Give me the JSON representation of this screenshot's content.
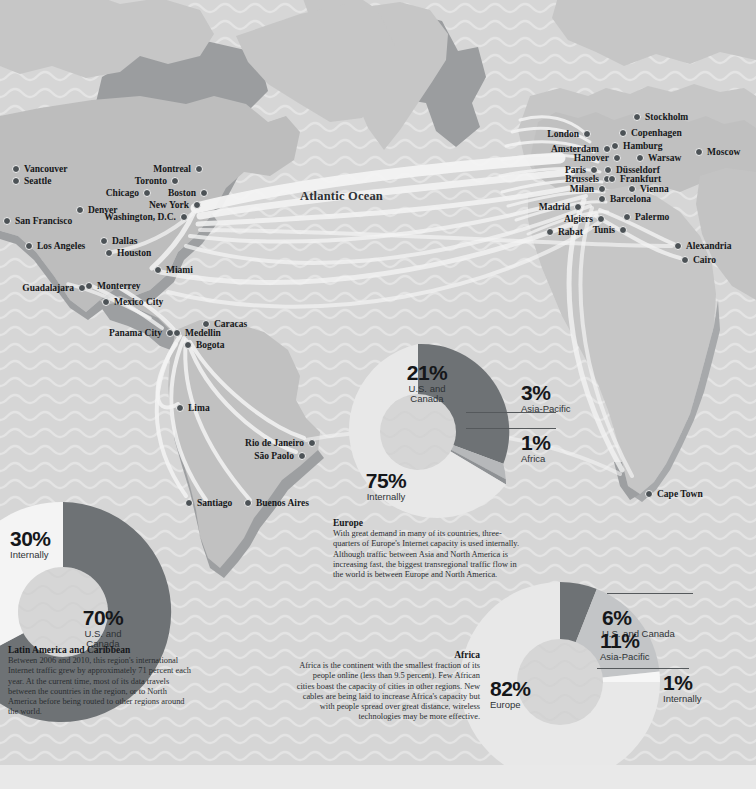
{
  "map": {
    "ocean_label": "Atlantic Ocean",
    "colors": {
      "background": "#d6d6d6",
      "wave": "#e2e2e2",
      "land": "#c6c6c6",
      "land_shadow": "#9d9fa1",
      "cable": "#f4f4f4",
      "marker": "#4c5256",
      "dark_slice": "#6e7275",
      "mid_slice": "#b4b6b8",
      "light_slice": "#e6e6e6"
    },
    "cities": [
      {
        "name": "Vancouver",
        "x": 12,
        "y": 164,
        "side": "right"
      },
      {
        "name": "Seattle",
        "x": 12,
        "y": 176,
        "side": "right"
      },
      {
        "name": "Montreal",
        "x": 189,
        "y": 164,
        "side": "left"
      },
      {
        "name": "Toronto",
        "x": 165,
        "y": 176,
        "side": "left"
      },
      {
        "name": "Chicago",
        "x": 137,
        "y": 188,
        "side": "left"
      },
      {
        "name": "Boston",
        "x": 194,
        "y": 188,
        "side": "left"
      },
      {
        "name": "New York",
        "x": 187,
        "y": 200,
        "side": "left"
      },
      {
        "name": "Denver",
        "x": 76,
        "y": 205,
        "side": "right"
      },
      {
        "name": "Washington, D.C.",
        "x": 174,
        "y": 212,
        "side": "left"
      },
      {
        "name": "San Francisco",
        "x": 3,
        "y": 216,
        "side": "right"
      },
      {
        "name": "Dallas",
        "x": 100,
        "y": 236,
        "side": "right"
      },
      {
        "name": "Houston",
        "x": 105,
        "y": 248,
        "side": "right"
      },
      {
        "name": "Los Angeles",
        "x": 25,
        "y": 241,
        "side": "right"
      },
      {
        "name": "Miami",
        "x": 154,
        "y": 265,
        "side": "right"
      },
      {
        "name": "Monterrey",
        "x": 85,
        "y": 281,
        "side": "right"
      },
      {
        "name": "Guadalajara",
        "x": 72,
        "y": 283,
        "side": "left"
      },
      {
        "name": "Mexico City",
        "x": 102,
        "y": 297,
        "side": "right"
      },
      {
        "name": "Panama City",
        "x": 160,
        "y": 328,
        "side": "left"
      },
      {
        "name": "Caracas",
        "x": 202,
        "y": 319,
        "side": "right"
      },
      {
        "name": "Medellin",
        "x": 173,
        "y": 328,
        "side": "right"
      },
      {
        "name": "Bogota",
        "x": 184,
        "y": 340,
        "side": "right"
      },
      {
        "name": "Lima",
        "x": 176,
        "y": 403,
        "side": "right"
      },
      {
        "name": "Rio de Janeiro",
        "x": 302,
        "y": 438,
        "side": "left"
      },
      {
        "name": "São Paolo",
        "x": 292,
        "y": 451,
        "side": "left"
      },
      {
        "name": "Santiago",
        "x": 185,
        "y": 498,
        "side": "right"
      },
      {
        "name": "Buenos Aires",
        "x": 244,
        "y": 498,
        "side": "right"
      },
      {
        "name": "Stockholm",
        "x": 633,
        "y": 112,
        "side": "right"
      },
      {
        "name": "Copenhagen",
        "x": 619,
        "y": 128,
        "side": "right"
      },
      {
        "name": "London",
        "x": 577,
        "y": 129,
        "side": "left"
      },
      {
        "name": "Hamburg",
        "x": 611,
        "y": 141,
        "side": "right"
      },
      {
        "name": "Moscow",
        "x": 695,
        "y": 147,
        "side": "right"
      },
      {
        "name": "Amsterdam",
        "x": 597,
        "y": 144,
        "side": "left"
      },
      {
        "name": "Warsaw",
        "x": 636,
        "y": 153,
        "side": "right"
      },
      {
        "name": "Hanover",
        "x": 607,
        "y": 153,
        "side": "left"
      },
      {
        "name": "Paris",
        "x": 584,
        "y": 165,
        "side": "left"
      },
      {
        "name": "Düsseldorf",
        "x": 604,
        "y": 165,
        "side": "right"
      },
      {
        "name": "Brussels",
        "x": 597,
        "y": 174,
        "side": "left"
      },
      {
        "name": "Frankfurt",
        "x": 608,
        "y": 174,
        "side": "right"
      },
      {
        "name": "Milan",
        "x": 592,
        "y": 184,
        "side": "left"
      },
      {
        "name": "Vienna",
        "x": 628,
        "y": 184,
        "side": "right"
      },
      {
        "name": "Barcelona",
        "x": 598,
        "y": 194,
        "side": "right"
      },
      {
        "name": "Madrid",
        "x": 568,
        "y": 202,
        "side": "left"
      },
      {
        "name": "Algiers",
        "x": 591,
        "y": 214,
        "side": "left"
      },
      {
        "name": "Palermo",
        "x": 623,
        "y": 212,
        "side": "right"
      },
      {
        "name": "Tunis",
        "x": 613,
        "y": 225,
        "side": "left"
      },
      {
        "name": "Rabat",
        "x": 546,
        "y": 227,
        "side": "right"
      },
      {
        "name": "Alexandria",
        "x": 674,
        "y": 241,
        "side": "right"
      },
      {
        "name": "Cairo",
        "x": 681,
        "y": 255,
        "side": "right"
      },
      {
        "name": "Cape Town",
        "x": 645,
        "y": 489,
        "side": "right"
      }
    ]
  },
  "charts": {
    "latin_america": {
      "heading": "Latin America and Caribbean",
      "body": "Between 2006 and 2010, this region's international Internet traffic grew by approximately 71 percent each year. At the current time, most of its data travels between the countries in the region, or to North America before being routed to other regions around the world.",
      "slices": [
        {
          "label": "U.S. and Canada",
          "value": 70,
          "display": "70%",
          "color": "#6e7275"
        },
        {
          "label": "Internally",
          "value": 30,
          "display": "30%",
          "color": "#f4f4f4"
        }
      ]
    },
    "europe": {
      "heading": "Europe",
      "body": "With great demand in many of its countries, three-quarters of Europe's Internet capacity is used internally. Although traffic between Asia and North America is increasing fast, the biggest transregional traffic flow in the world is between Europe and North America.",
      "slices": [
        {
          "label": "Internally",
          "value": 75,
          "display": "75%",
          "color": "#e8e8e8"
        },
        {
          "label": "U.S. and Canada",
          "value": 21,
          "display": "21%",
          "color": "#6e7275"
        },
        {
          "label": "Asia-Pacific",
          "value": 3,
          "display": "3%",
          "color": "#b6b8ba"
        },
        {
          "label": "Africa",
          "value": 1,
          "display": "1%",
          "color": "#8e9194"
        }
      ]
    },
    "africa": {
      "heading": "Africa",
      "body": "Africa is the continent with the smallest fraction of its people online (less than 9.5 percent). Few African cities boast the capacity of cities in other regions. New cables are being laid to increase Africa's capacity but with people spread over great distance, wireless technologies may be more effective.",
      "slices": [
        {
          "label": "Europe",
          "value": 82,
          "display": "82%",
          "color": "#e8e8e8"
        },
        {
          "label": "U.S. and Canada",
          "value": 6,
          "display": "6%",
          "color": "#6e7275"
        },
        {
          "label": "Asia-Pacific",
          "value": 11,
          "display": "11%",
          "color": "#c3c5c7"
        },
        {
          "label": "Internally",
          "value": 1,
          "display": "1%",
          "color": "#f6f6f6"
        }
      ]
    }
  },
  "chart_data": [
    {
      "type": "pie",
      "title": "Latin America and Caribbean",
      "categories": [
        "U.S. and Canada",
        "Internally"
      ],
      "values": [
        70,
        30
      ],
      "units": "percent of Internet traffic",
      "legend": "labels-on-slices"
    },
    {
      "type": "pie",
      "title": "Europe",
      "categories": [
        "Internally",
        "U.S. and Canada",
        "Asia-Pacific",
        "Africa"
      ],
      "values": [
        75,
        21,
        3,
        1
      ],
      "units": "percent of Internet traffic",
      "legend": "labels-on-slices"
    },
    {
      "type": "pie",
      "title": "Africa",
      "categories": [
        "Europe",
        "Asia-Pacific",
        "U.S. and Canada",
        "Internally"
      ],
      "values": [
        82,
        11,
        6,
        1
      ],
      "units": "percent of Internet traffic",
      "legend": "labels-on-slices"
    }
  ]
}
